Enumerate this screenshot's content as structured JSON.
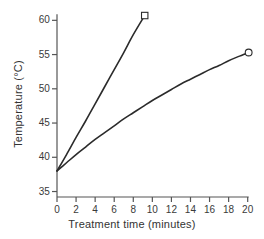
{
  "chart_data": {
    "type": "line",
    "title": "",
    "xlabel": "Treatment time (minutes)",
    "ylabel": "Temperature (°C)",
    "xlim": [
      0,
      21.5
    ],
    "ylim": [
      34.2,
      61.8
    ],
    "xticks": [
      0,
      2,
      4,
      6,
      8,
      10,
      12,
      14,
      16,
      18,
      20
    ],
    "xtick_labels": [
      "0",
      "2",
      "4",
      "6",
      "8",
      "10",
      "12",
      "14",
      "16",
      "18",
      "20"
    ],
    "yticks": [
      35,
      40,
      45,
      50,
      55,
      60
    ],
    "ytick_labels": [
      "35",
      "40",
      "45",
      "50",
      "55",
      "60"
    ],
    "grid": false,
    "legend": "none",
    "axis_color": "#555555",
    "line_color": "#2b2b2b",
    "series": [
      {
        "name": "steep-rise",
        "marker": "open-square",
        "marker_point": {
          "x": 9.2,
          "y": 60.7
        },
        "x": [
          0.0,
          1.0,
          2.0,
          3.0,
          4.0,
          5.0,
          6.0,
          7.0,
          8.0,
          9.2
        ],
        "y": [
          38.0,
          40.4,
          42.9,
          45.3,
          47.8,
          50.3,
          52.8,
          55.3,
          57.9,
          60.7
        ]
      },
      {
        "name": "gradual-rise",
        "marker": "open-circle",
        "marker_point": {
          "x": 20.1,
          "y": 55.3
        },
        "x": [
          0.0,
          1.0,
          2.0,
          3.0,
          4.0,
          5.0,
          6.0,
          7.0,
          8.0,
          9.0,
          10.0,
          11.0,
          12.0,
          13.0,
          14.0,
          15.0,
          16.0,
          17.0,
          18.0,
          19.0,
          20.1
        ],
        "y": [
          38.0,
          39.2,
          40.4,
          41.5,
          42.6,
          43.6,
          44.6,
          45.6,
          46.5,
          47.4,
          48.3,
          49.1,
          49.9,
          50.7,
          51.4,
          52.1,
          52.8,
          53.4,
          54.1,
          54.7,
          55.3
        ]
      }
    ]
  },
  "axes_geometry": {
    "left_px": 57,
    "right_px": 262,
    "top_px": 8,
    "bottom_px": 197,
    "x_data_min": 0,
    "x_data_max": 21.5,
    "y_data_min": 34.2,
    "y_data_max": 61.8
  },
  "caption": {
    "remnant": ""
  }
}
